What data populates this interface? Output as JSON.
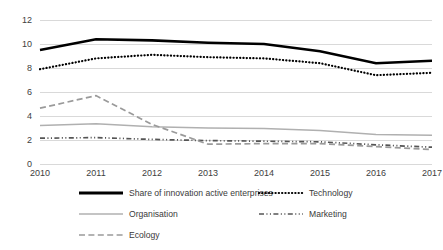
{
  "chart_data": {
    "type": "line",
    "title": "",
    "xlabel": "",
    "ylabel": "",
    "categories": [
      "2010",
      "2011",
      "2012",
      "2013",
      "2014",
      "2015",
      "2016",
      "2017"
    ],
    "x": [
      2010,
      2011,
      2012,
      2013,
      2014,
      2015,
      2016,
      2017
    ],
    "ylim": [
      0,
      12
    ],
    "yticks": [
      0,
      2,
      4,
      6,
      8,
      10,
      12
    ],
    "ytick_labels": [
      "0",
      "2",
      "4",
      "6",
      "8",
      "10",
      "12"
    ],
    "grid": true,
    "legend_position": "bottom",
    "series": [
      {
        "name": "Share of innovation active enterprises",
        "style": "solid-thick",
        "color": "#000000",
        "values": [
          9.5,
          10.4,
          10.3,
          10.1,
          10.0,
          9.4,
          8.4,
          8.6
        ]
      },
      {
        "name": "Technology",
        "style": "dotted",
        "color": "#000000",
        "values": [
          7.9,
          8.8,
          9.1,
          8.9,
          8.8,
          8.4,
          7.4,
          7.6
        ]
      },
      {
        "name": "Organisation",
        "style": "solid-thin",
        "color": "#b0b0b0",
        "values": [
          3.2,
          3.35,
          3.1,
          3.0,
          2.95,
          2.8,
          2.45,
          2.4
        ]
      },
      {
        "name": "Marketing",
        "style": "dash-dot-dot",
        "color": "#555555",
        "values": [
          2.15,
          2.2,
          2.05,
          1.95,
          1.9,
          1.85,
          1.6,
          1.4
        ]
      },
      {
        "name": "Ecology",
        "style": "dashed",
        "color": "#9a9a9a",
        "values": [
          4.65,
          5.7,
          3.3,
          1.65,
          1.7,
          1.7,
          1.45,
          1.2
        ]
      }
    ]
  },
  "axis": {
    "y_label_texts": [
      "12",
      "10",
      "8",
      "6",
      "4",
      "2",
      "0"
    ]
  },
  "legend": {
    "items": [
      {
        "label": "Share of innovation active enterprises",
        "key": "solid-thick"
      },
      {
        "label": "Technology",
        "key": "dotted"
      },
      {
        "label": "Organisation",
        "key": "solid-thin"
      },
      {
        "label": "Marketing",
        "key": "dash-dot-dot"
      },
      {
        "label": "Ecology",
        "key": "dashed"
      }
    ]
  }
}
